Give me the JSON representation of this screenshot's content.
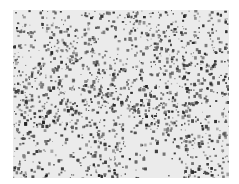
{
  "image": {
    "description": "Grayscale micrograph-like speckled texture with dark granular clusters forming wavy bands across a light background",
    "palette": {
      "background": "#ffffff",
      "light": "#ebebeb",
      "dark": "#2e2e2e",
      "mid": "#7a7a7a"
    }
  }
}
